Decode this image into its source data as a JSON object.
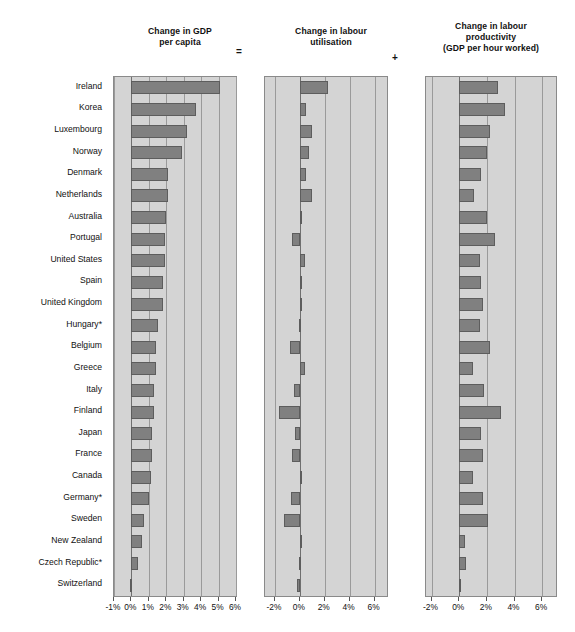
{
  "figure": {
    "operators": [
      "=",
      "+"
    ],
    "panels": [
      {
        "title_lines": [
          "Change in GDP",
          "per capita"
        ]
      },
      {
        "title_lines": [
          "Change in labour",
          "utilisation"
        ]
      },
      {
        "title_lines": [
          "Change in labour",
          "productivity",
          "(GDP per hour worked)"
        ]
      }
    ]
  },
  "chart_data": {
    "type": "bar",
    "orientation": "horizontal",
    "title": "",
    "grid": true,
    "legend": "none",
    "note": "Three-panel horizontal bar chart: Change in GDP per capita = Change in labour utilisation + Change in labour productivity. Countries sorted descending by GDP per capita growth. Asterisk marks countries with a footnote.",
    "categories": [
      "Ireland",
      "Korea",
      "Luxembourg",
      "Norway",
      "Denmark",
      "Netherlands",
      "Australia",
      "Portugal",
      "United States",
      "Spain",
      "United Kingdom",
      "Hungary*",
      "Belgium",
      "Greece",
      "Italy",
      "Finland",
      "Japan",
      "France",
      "Canada",
      "Germany*",
      "Sweden",
      "New Zealand",
      "Czech Republic*",
      "Switzerland"
    ],
    "panels": [
      {
        "name": "Change in GDP per capita",
        "xlabel": "",
        "ylabel": "",
        "xlim": [
          -1,
          6
        ],
        "xticks": [
          -1,
          0,
          1,
          2,
          3,
          4,
          5,
          6
        ],
        "xticklabels": [
          "-1%",
          "0%",
          "1%",
          "2%",
          "3%",
          "4%",
          "5%",
          "6%"
        ],
        "values": [
          5.1,
          3.7,
          3.2,
          2.9,
          2.1,
          2.1,
          2.0,
          1.9,
          1.9,
          1.8,
          1.8,
          1.5,
          1.4,
          1.4,
          1.3,
          1.3,
          1.2,
          1.2,
          1.1,
          1.0,
          0.7,
          0.6,
          0.4,
          -0.1
        ]
      },
      {
        "name": "Change in labour utilisation",
        "xlabel": "",
        "ylabel": "",
        "xlim": [
          -2.8,
          7.0
        ],
        "xticks": [
          -2,
          0,
          2,
          4,
          6
        ],
        "xticklabels": [
          "-2%",
          "0%",
          "2%",
          "4%",
          "6%"
        ],
        "values": [
          2.3,
          0.5,
          1.0,
          0.7,
          0.5,
          1.0,
          0.1,
          -0.6,
          0.4,
          0.2,
          0.1,
          -0.1,
          -0.8,
          0.4,
          -0.5,
          -1.7,
          -0.4,
          -0.6,
          0.1,
          -0.7,
          -1.3,
          0.2,
          -0.1,
          -0.2
        ]
      },
      {
        "name": "Change in labour productivity (GDP per hour worked)",
        "xlabel": "",
        "ylabel": "",
        "xlim": [
          -2.4,
          7.0
        ],
        "xticks": [
          -2,
          0,
          2,
          4,
          6
        ],
        "xticklabels": [
          "-2%",
          "0%",
          "2%",
          "4%",
          "6%"
        ],
        "values": [
          2.8,
          3.3,
          2.2,
          2.0,
          1.6,
          1.1,
          2.0,
          2.6,
          1.5,
          1.6,
          1.7,
          1.5,
          2.2,
          1.0,
          1.8,
          3.0,
          1.6,
          1.7,
          1.0,
          1.7,
          2.1,
          0.4,
          0.5,
          0.1
        ]
      }
    ]
  }
}
